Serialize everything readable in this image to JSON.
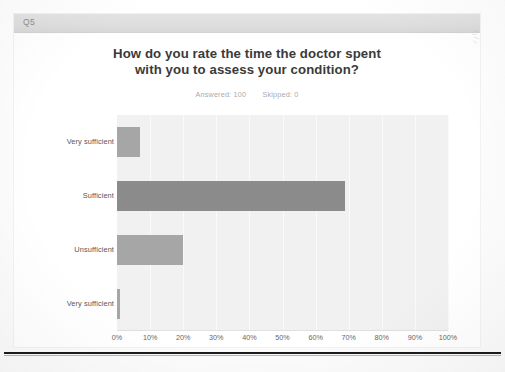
{
  "survey": {
    "question_number": "Q5",
    "title_line1": "How do you rate the time the doctor spent",
    "title_line2": "with you to assess your condition?",
    "answered_label": "Answered: 100",
    "skipped_label": "Skipped: 0"
  },
  "colors": {
    "bar_light": "#a6a6a6",
    "bar_dark": "#8b8b8b",
    "plot_background": "#f1f1f1",
    "header_bar": "#dedede",
    "title_text": "#3a3a3a",
    "axis_text": "#666666"
  },
  "chart_data": {
    "type": "bar",
    "orientation": "horizontal",
    "title": "How do you rate the time the doctor spent with you to assess your condition?",
    "subtitle": "Answered: 100   Skipped: 0",
    "xlabel": "",
    "ylabel": "",
    "categories": [
      "Very sufficient",
      "Sufficient",
      "Unsufficient",
      "Very sufficient"
    ],
    "values": [
      7,
      69,
      20,
      1
    ],
    "unit": "%",
    "xlim": [
      0,
      100
    ],
    "tick_labels": [
      "0%",
      "10%",
      "20%",
      "30%",
      "40%",
      "50%",
      "60%",
      "70%",
      "80%",
      "90%",
      "100%"
    ],
    "tick_values": [
      0,
      10,
      20,
      30,
      40,
      50,
      60,
      70,
      80,
      90,
      100
    ],
    "grid": true,
    "legend": false,
    "series": [
      {
        "name": "Responses",
        "values": [
          7,
          69,
          20,
          1
        ]
      }
    ]
  }
}
